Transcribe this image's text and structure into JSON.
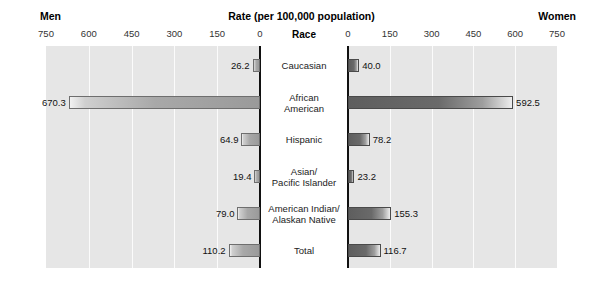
{
  "header": {
    "left_label": "Men",
    "center_label": "Rate (per 100,000 population)",
    "right_label": "Women"
  },
  "center_column": {
    "title": "Race"
  },
  "chart_data": {
    "type": "bar",
    "orientation": "horizontal-diverging",
    "title": "Rate (per 100,000 population)",
    "xlabel": "Rate (per 100,000 population)",
    "ylabel": "Race",
    "categories": [
      "Caucasian",
      "African American",
      "Hispanic",
      "Asian/ Pacific Islander",
      "American Indian/ Alaskan Native",
      "Total"
    ],
    "category_lines": [
      [
        "Caucasian"
      ],
      [
        "African",
        "American"
      ],
      [
        "Hispanic"
      ],
      [
        "Asian/",
        "Pacific Islander"
      ],
      [
        "American Indian/",
        "Alaskan Native"
      ],
      [
        "Total"
      ]
    ],
    "series": [
      {
        "name": "Men",
        "side": "left",
        "values": [
          26.2,
          670.3,
          64.9,
          19.4,
          79.0,
          110.2
        ],
        "labels": [
          "26.2",
          "670.3",
          "64.9",
          "19.4",
          "79.0",
          "110.2"
        ]
      },
      {
        "name": "Women",
        "side": "right",
        "values": [
          40.0,
          592.5,
          78.2,
          23.2,
          155.3,
          116.7
        ],
        "labels": [
          "40.0",
          "592.5",
          "78.2",
          "23.2",
          "155.3",
          "116.7"
        ]
      }
    ],
    "axis_left_ticks": [
      750,
      600,
      450,
      300,
      150,
      0
    ],
    "axis_left_tick_labels": [
      "750",
      "600",
      "450",
      "300",
      "150",
      "0"
    ],
    "axis_right_ticks": [
      0,
      150,
      300,
      450,
      600,
      750
    ],
    "axis_right_tick_labels": [
      "0",
      "150",
      "300",
      "450",
      "600",
      "750"
    ],
    "xlim": [
      0,
      750
    ],
    "grid": true,
    "legend": "none",
    "colors": {
      "panel_background": "#e6e6e6",
      "gridline": "#fbfbfb",
      "axis": "#111111",
      "bar_men": "#a8a8a8",
      "bar_women": "#6a6a6a",
      "page_background": "#ffffff"
    }
  }
}
